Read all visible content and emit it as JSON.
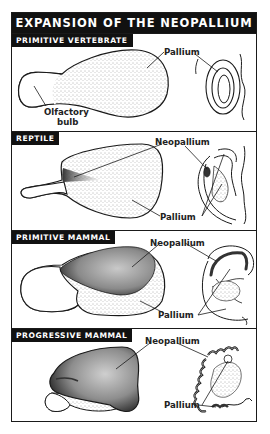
{
  "title": "EXPANSION OF THE NEOPALLIUM",
  "colors": {
    "frame": "#1a1a1a",
    "label_bg": "#111111",
    "label_text": "#ffffff",
    "stipple": "#8a8a8a",
    "neopallium_dark": "#2a2a2a"
  },
  "panels": [
    {
      "label": "PRIMITIVE VERTEBRATE",
      "callouts": {
        "pallium": "Pallium",
        "olfactory_line1": "Olfactory",
        "olfactory_line2": "bulb"
      }
    },
    {
      "label": "REPTILE",
      "callouts": {
        "neopallium": "Neopallium",
        "pallium": "Pallium"
      }
    },
    {
      "label": "PRIMITIVE MAMMAL",
      "callouts": {
        "neopallium": "Neopallium",
        "pallium": "Pallium"
      }
    },
    {
      "label": "PROGRESSIVE MAMMAL",
      "callouts": {
        "neopallium": "Neopallium",
        "pallium": "Pallium"
      }
    }
  ]
}
